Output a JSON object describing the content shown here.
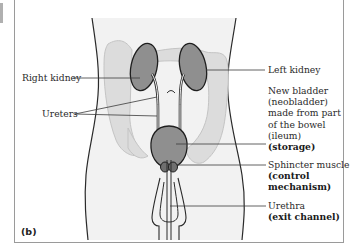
{
  "figure": {
    "panel_label": "(b)",
    "labels": {
      "right_kidney": "Right kidney",
      "left_kidney": "Left kidney",
      "ureters": "Ureters",
      "neobladder": [
        "New bladder",
        "(neobladder)",
        "made from part",
        "of the bowel",
        "(ileum)"
      ],
      "neobladder_role": "(storage)",
      "sphincter": "Sphincter muscle",
      "sphincter_role": [
        "(control",
        "mechanism)"
      ],
      "urethra": "Urethra",
      "urethra_role": "(exit channel)"
    },
    "colors": {
      "organ_fill": "#8f8f8f",
      "bowel_fill": "#dcdcdc",
      "body_fill": "#f1f1f1",
      "outline": "#2a2a2a",
      "frame": "#9a9a9a"
    }
  }
}
